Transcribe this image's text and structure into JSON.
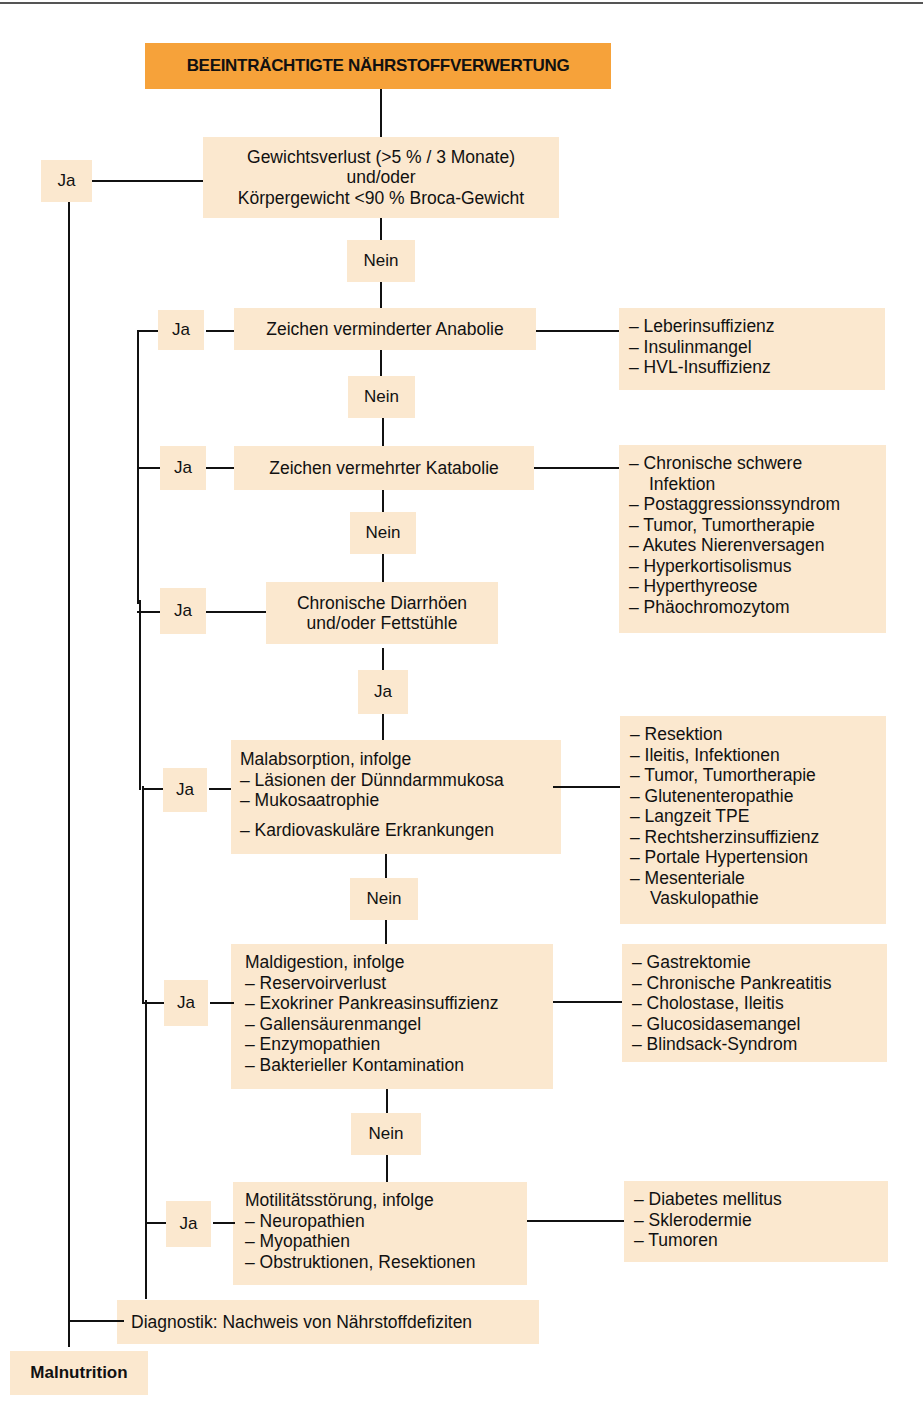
{
  "title": "BEEINTRÄCHTIGTE NÄHRSTOFFVERWERTUNG",
  "steps": [
    {
      "id": "gewichtsverlust",
      "lines": [
        "Gewichtsverlust (>5 % / 3 Monate)",
        "und/oder",
        "Körpergewicht <90 % Broca-Gewicht"
      ],
      "yes": "Ja",
      "no": "Nein"
    },
    {
      "id": "anabolie",
      "lines": [
        "Zeichen verminderter Anabolie"
      ],
      "yes": "Ja",
      "no": "Nein",
      "causes": [
        "– Leberinsuffizienz",
        "– Insulinmangel",
        "– HVL-Insuffizienz"
      ]
    },
    {
      "id": "katabolie",
      "lines": [
        "Zeichen vermehrter Katabolie"
      ],
      "yes": "Ja",
      "no": "Nein",
      "causes": [
        "– Chronische schwere",
        "Infektion",
        "– Postaggressionssyndrom",
        "– Tumor, Tumortherapie",
        "– Akutes Nierenversagen",
        "– Hyperkortisolismus",
        "– Hyperthyreose",
        "– Phäochromozytom"
      ]
    },
    {
      "id": "diarrhoe",
      "lines": [
        "Chronische Diarrhöen",
        "und/oder Fettstühle"
      ],
      "yes": "Ja",
      "down": "Ja"
    },
    {
      "id": "malabsorption",
      "lines": [
        "Malabsorption, infolge",
        "– Läsionen der Dünndarmmukosa",
        "– Mukosaatrophie",
        "– Kardiovaskuläre Erkrankungen"
      ],
      "yes": "Ja",
      "no": "Nein",
      "causes": [
        "– Resektion",
        "– Ileitis, Infektionen",
        "– Tumor, Tumortherapie",
        "– Glutenenteropathie",
        "– Langzeit TPE",
        "– Rechtsherzinsuffizienz",
        "– Portale Hypertension",
        "– Mesenteriale",
        "Vaskulopathie"
      ]
    },
    {
      "id": "maldigestion",
      "lines": [
        "Maldigestion, infolge",
        "– Reservoirverlust",
        "– Exokriner Pankreasinsuffizienz",
        "– Gallensäurenmangel",
        "– Enzymopathien",
        "– Bakterieller Kontamination"
      ],
      "yes": "Ja",
      "no": "Nein",
      "causes": [
        "– Gastrektomie",
        "– Chronische Pankreatitis",
        "– Cholostase, Ileitis",
        "– Glucosidasemangel",
        "– Blindsack-Syndrom"
      ]
    },
    {
      "id": "motilitaet",
      "lines": [
        "Motilitätsstörung, infolge",
        "– Neuropathien",
        "– Myopathien",
        "– Obstruktionen, Resektionen"
      ],
      "yes": "Ja",
      "causes": [
        "– Diabetes mellitus",
        "– Sklerodermie",
        "– Tumoren"
      ]
    }
  ],
  "diagnostik": "Diagnostik: Nachweis von Nährstoffdefiziten",
  "result": "Malnutrition",
  "colors": {
    "title_bg": "#f6a23a",
    "box_bg": "#fbe8cf",
    "line": "#111111"
  }
}
